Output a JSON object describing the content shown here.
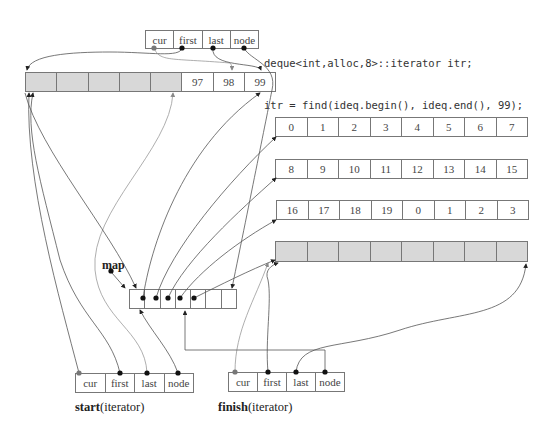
{
  "code": {
    "line1": "deque<int,alloc,8>::iterator itr;",
    "line2": "itr = find(ideq.begin(), ideq.end(), 99);"
  },
  "itr_fields": [
    "cur",
    "first",
    "last",
    "node"
  ],
  "start_fields": [
    "cur",
    "first",
    "last",
    "node"
  ],
  "finish_fields": [
    "cur",
    "first",
    "last",
    "node"
  ],
  "start_label": {
    "name": "start",
    "type": "(iterator)"
  },
  "finish_label": {
    "name": "finish",
    "type": "(iterator)"
  },
  "map_label": "map",
  "top_buffer": [
    "",
    "",
    "",
    "",
    "",
    "97",
    "98",
    "99"
  ],
  "buffers": [
    [
      "0",
      "1",
      "2",
      "3",
      "4",
      "5",
      "6",
      "7"
    ],
    [
      "8",
      "9",
      "10",
      "11",
      "12",
      "13",
      "14",
      "15"
    ],
    [
      "16",
      "17",
      "18",
      "19",
      "0",
      "1",
      "2",
      "3"
    ],
    [
      "",
      "",
      "",
      "",
      "",
      "",
      "",
      ""
    ]
  ],
  "map_cells": 8,
  "colors": {
    "line": "#777777",
    "dot": "#111111",
    "gray_dot": "#777777",
    "shade": "#d8d8d8"
  }
}
